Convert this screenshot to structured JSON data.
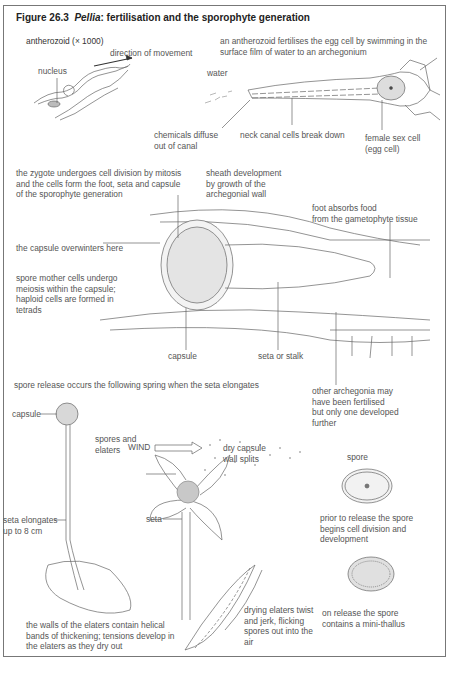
{
  "figure": {
    "number": "Figure 26.3",
    "title_italic": "Pellia",
    "title_rest": ": fertilisation and the sporophyte generation"
  },
  "fertilisation": {
    "antherozoid_label": "antherozoid (× 1000)",
    "direction_label": "direction of movement",
    "nucleus_label": "nucleus",
    "description": "an antherozoid fertilises the egg cell by swimming in the surface film of water to an archegonium",
    "water_label": "water",
    "chemicals_label": "chemicals diffuse\nout of canal",
    "neck_canal_label": "neck canal cells break down",
    "female_cell_label": "female sex cell\n(egg cell)"
  },
  "sporophyte": {
    "zygote_text": "the zygote undergoes cell division by mitosis\nand the cells form the foot, seta and capsule\nof the sporophyte generation",
    "sheath_label": "sheath development\nby growth of the\narchegonial wall",
    "foot_label": "foot absorbs food\nfrom the gametophyte tissue",
    "overwinters_text": "the capsule overwinters here",
    "spore_mother_text": "spore mother cells undergo\nmeiosis within the capsule;\nhaploid cells are formed in\ntetrads",
    "capsule_label": "capsule",
    "seta_stalk_label": "seta or stalk",
    "other_archegonia_label": "other archegonia may\nhave been fertilised\nbut only one developed\nfurther"
  },
  "release": {
    "heading": "spore release occurs the following spring when the seta elongates",
    "capsule_label": "capsule",
    "wind_label": "WIND",
    "spores_elaters_label": "spores and\nelaters",
    "dry_capsule_label": "dry capsule\nwall splits",
    "seta_label": "seta",
    "seta_elongates_label": "seta elongates\nup to 8 cm",
    "spore_label": "spore",
    "prior_release_text": "prior to release the spore\nbegins cell division and\ndevelopment",
    "elaters_walls_text": "the walls of the elaters contain helical\nbands of thickening; tensions develop in\nthe elaters as they dry out",
    "drying_elaters_text": "drying elaters twist\nand jerk, flicking\nspores out into the\nair",
    "on_release_text": "on release the spore\ncontains a mini-thallus"
  }
}
